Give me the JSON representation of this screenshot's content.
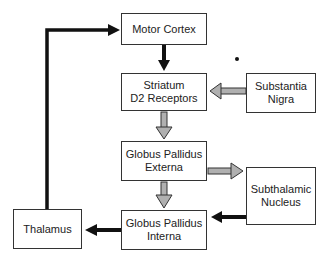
{
  "diagram": {
    "nodes": [
      {
        "id": "motor-cortex",
        "label": "Motor Cortex"
      },
      {
        "id": "striatum",
        "label": "Striatum\nD2 Receptors"
      },
      {
        "id": "substantia-nigra",
        "label": "Substantia\nNigra"
      },
      {
        "id": "gpe",
        "label": "Globus Pallidus\nExterna"
      },
      {
        "id": "stn",
        "label": "Subthalamic\nNucleus"
      },
      {
        "id": "gpi",
        "label": "Globus Pallidus\nInterna"
      },
      {
        "id": "thalamus",
        "label": "Thalamus"
      }
    ],
    "edges": [
      {
        "from": "motor-cortex",
        "to": "striatum",
        "style": "black"
      },
      {
        "from": "substantia-nigra",
        "to": "striatum",
        "style": "gray"
      },
      {
        "from": "striatum",
        "to": "gpe",
        "style": "gray"
      },
      {
        "from": "gpe",
        "to": "stn",
        "style": "gray"
      },
      {
        "from": "gpe",
        "to": "gpi",
        "style": "gray"
      },
      {
        "from": "stn",
        "to": "gpi",
        "style": "black"
      },
      {
        "from": "gpi",
        "to": "thalamus",
        "style": "black"
      },
      {
        "from": "thalamus",
        "to": "motor-cortex",
        "style": "black"
      }
    ],
    "colors": {
      "excitatory": "#111111",
      "inhibitory_fill": "#b0b0b0",
      "border": "#333333"
    }
  }
}
